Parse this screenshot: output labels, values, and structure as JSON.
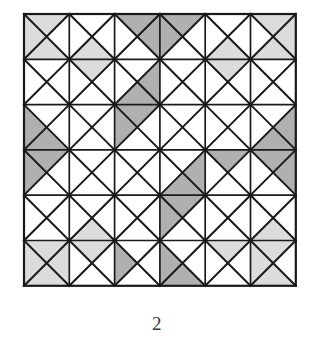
{
  "figure": {
    "caption": "2",
    "type": "quilt-block-pattern",
    "colors": {
      "background": "#ffffff",
      "light_shade": "#dcdcdc",
      "dark_shade": "#b0b0b0",
      "line": "#1a1a1a",
      "caption_text": "#3a3a3a"
    },
    "geometry": {
      "origin_x": 24,
      "origin_y": 14,
      "cell_size": 45.3,
      "rows": 6,
      "cols": 6,
      "outer_stroke_width": 2.2,
      "grid_stroke_width": 1.7,
      "diagonal_stroke_width": 2.0
    },
    "legend": [
      {
        "swatch": "#dcdcdc",
        "label": "light shaded triangle"
      },
      {
        "swatch": "#b0b0b0",
        "label": "dark shaded triangle"
      },
      {
        "swatch": "#ffffff",
        "label": "unshaded triangle"
      }
    ]
  },
  "chart_data": {
    "type": "heatmap",
    "title": "2",
    "xlabel": "",
    "ylabel": "",
    "categories": [
      "c0",
      "c1",
      "c2",
      "c3",
      "c4",
      "c5"
    ],
    "rows": [
      "r0",
      "r1",
      "r2",
      "r3",
      "r4",
      "r5"
    ],
    "note": "Each cell holds four triangles in order north, east, south, west. Value 0 = white, 1 = light gray, 2 = dark gray.",
    "cells": [
      [
        {
          "row": 0,
          "col": 0,
          "n": 1,
          "e": 0,
          "s": 1,
          "w": 1
        },
        {
          "row": 0,
          "col": 1,
          "n": 0,
          "e": 0,
          "s": 1,
          "w": 0
        },
        {
          "row": 0,
          "col": 2,
          "n": 2,
          "e": 2,
          "s": 0,
          "w": 0
        },
        {
          "row": 0,
          "col": 3,
          "n": 2,
          "e": 0,
          "s": 0,
          "w": 2
        },
        {
          "row": 0,
          "col": 4,
          "n": 0,
          "e": 0,
          "s": 1,
          "w": 0
        },
        {
          "row": 0,
          "col": 5,
          "n": 1,
          "e": 1,
          "s": 1,
          "w": 0
        }
      ],
      [
        {
          "row": 1,
          "col": 0,
          "n": 0,
          "e": 0,
          "s": 0,
          "w": 0
        },
        {
          "row": 1,
          "col": 1,
          "n": 1,
          "e": 0,
          "s": 0,
          "w": 0
        },
        {
          "row": 1,
          "col": 2,
          "n": 0,
          "e": 2,
          "s": 2,
          "w": 0
        },
        {
          "row": 1,
          "col": 3,
          "n": 0,
          "e": 0,
          "s": 0,
          "w": 0
        },
        {
          "row": 1,
          "col": 4,
          "n": 1,
          "e": 0,
          "s": 0,
          "w": 0
        },
        {
          "row": 1,
          "col": 5,
          "n": 0,
          "e": 0,
          "s": 0,
          "w": 0
        }
      ],
      [
        {
          "row": 2,
          "col": 0,
          "n": 0,
          "e": 0,
          "s": 2,
          "w": 2
        },
        {
          "row": 2,
          "col": 1,
          "n": 0,
          "e": 0,
          "s": 0,
          "w": 0
        },
        {
          "row": 2,
          "col": 2,
          "n": 2,
          "e": 0,
          "s": 0,
          "w": 2
        },
        {
          "row": 2,
          "col": 3,
          "n": 0,
          "e": 0,
          "s": 0,
          "w": 0
        },
        {
          "row": 2,
          "col": 4,
          "n": 0,
          "e": 0,
          "s": 0,
          "w": 0
        },
        {
          "row": 2,
          "col": 5,
          "n": 0,
          "e": 2,
          "s": 2,
          "w": 0
        }
      ],
      [
        {
          "row": 3,
          "col": 0,
          "n": 2,
          "e": 0,
          "s": 0,
          "w": 2
        },
        {
          "row": 3,
          "col": 1,
          "n": 0,
          "e": 0,
          "s": 0,
          "w": 0
        },
        {
          "row": 3,
          "col": 2,
          "n": 0,
          "e": 0,
          "s": 0,
          "w": 0
        },
        {
          "row": 3,
          "col": 3,
          "n": 0,
          "e": 2,
          "s": 2,
          "w": 0
        },
        {
          "row": 3,
          "col": 4,
          "n": 2,
          "e": 0,
          "s": 0,
          "w": 0
        },
        {
          "row": 3,
          "col": 5,
          "n": 2,
          "e": 2,
          "s": 0,
          "w": 0
        }
      ],
      [
        {
          "row": 4,
          "col": 0,
          "n": 0,
          "e": 0,
          "s": 0,
          "w": 0
        },
        {
          "row": 4,
          "col": 1,
          "n": 0,
          "e": 0,
          "s": 1,
          "w": 0
        },
        {
          "row": 4,
          "col": 2,
          "n": 0,
          "e": 0,
          "s": 0,
          "w": 0
        },
        {
          "row": 4,
          "col": 3,
          "n": 2,
          "e": 0,
          "s": 0,
          "w": 2
        },
        {
          "row": 4,
          "col": 4,
          "n": 0,
          "e": 0,
          "s": 0,
          "w": 0
        },
        {
          "row": 4,
          "col": 5,
          "n": 0,
          "e": 0,
          "s": 1,
          "w": 0
        }
      ],
      [
        {
          "row": 5,
          "col": 0,
          "n": 1,
          "e": 1,
          "s": 1,
          "w": 1
        },
        {
          "row": 5,
          "col": 1,
          "n": 1,
          "e": 0,
          "s": 0,
          "w": 0
        },
        {
          "row": 5,
          "col": 2,
          "n": 0,
          "e": 0,
          "s": 0,
          "w": 2
        },
        {
          "row": 5,
          "col": 3,
          "n": 0,
          "e": 0,
          "s": 2,
          "w": 2
        },
        {
          "row": 5,
          "col": 4,
          "n": 1,
          "e": 0,
          "s": 0,
          "w": 0
        },
        {
          "row": 5,
          "col": 5,
          "n": 1,
          "e": 0,
          "s": 1,
          "w": 1
        }
      ]
    ]
  }
}
